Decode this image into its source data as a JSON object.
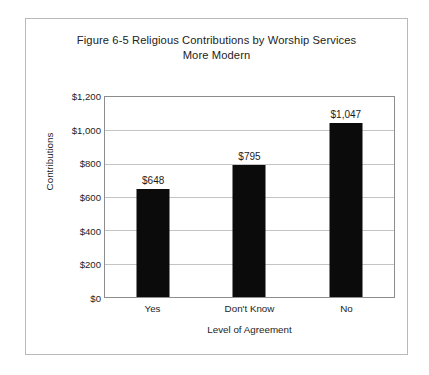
{
  "chart_data": {
    "type": "bar",
    "title": "Figure 6-5 Religious Contributions by Worship Services",
    "subtitle": "More Modern",
    "categories": [
      "Yes",
      "Don't Know",
      "No"
    ],
    "values": [
      648,
      795,
      1047
    ],
    "data_labels": [
      "$648",
      "$795",
      "$1,047"
    ],
    "xlabel": "Level of Agreement",
    "ylabel": "Contributions",
    "ylim": [
      0,
      1200
    ],
    "ytick_values": [
      0,
      200,
      400,
      600,
      800,
      1000,
      1200
    ],
    "ytick_labels": [
      "$0",
      "$200",
      "$400",
      "$600",
      "$800",
      "$1,000",
      "$1,200"
    ],
    "grid": "horizontal",
    "legend": "none",
    "bar_color": "#0b0b0b",
    "plot_border_color": "#8d8d8d",
    "gridline_color": "#c4c4c4",
    "frame_border_color": "#b9b9b9",
    "background_color": "#ffffff"
  }
}
